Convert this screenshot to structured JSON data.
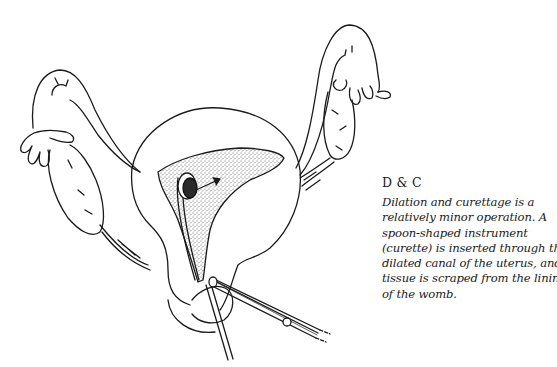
{
  "caption": {
    "title": "D & C",
    "body_lines": [
      "Dilation and curettage is a",
      "relatively minor operation. A",
      "spoon-shaped instrument",
      "(curette) is inserted through the",
      "dilated canal of the uterus, and",
      "tissue is scraped from the lining",
      "of the womb."
    ]
  },
  "illustration": {
    "subject": "uterus-with-curette",
    "colors": {
      "ink": "#1a1a1a",
      "background": "#ffffff",
      "stipple": "#9a9a9a"
    }
  }
}
